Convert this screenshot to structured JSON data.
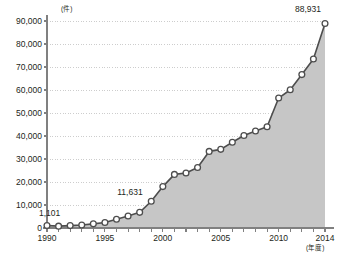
{
  "chart_data": {
    "type": "area",
    "title": "",
    "subtitle": "",
    "xlabel": "(年度)",
    "ylabel": "(件)",
    "x": [
      1990,
      1991,
      1992,
      1993,
      1994,
      1995,
      1996,
      1997,
      1998,
      1999,
      2000,
      2001,
      2002,
      2003,
      2004,
      2005,
      2006,
      2007,
      2008,
      2009,
      2010,
      2011,
      2012,
      2013,
      2014
    ],
    "values": [
      1101,
      800,
      1050,
      1300,
      1800,
      2400,
      3800,
      5200,
      6800,
      11631,
      18000,
      23300,
      23900,
      26300,
      33300,
      34200,
      37300,
      40200,
      42200,
      44000,
      56500,
      60100,
      66700,
      73500,
      88931
    ],
    "series": [
      {
        "name": "件数",
        "values": [
          1101,
          800,
          1050,
          1300,
          1800,
          2400,
          3800,
          5200,
          6800,
          11631,
          18000,
          23300,
          23900,
          26300,
          33300,
          34200,
          37300,
          40200,
          42200,
          44000,
          56500,
          60100,
          66700,
          73500,
          88931
        ]
      }
    ],
    "xlim": [
      1990,
      2014
    ],
    "ylim": [
      0,
      90000
    ],
    "ytick_labels": [
      "0",
      "10,000",
      "20,000",
      "30,000",
      "40,000",
      "50,000",
      "60,000",
      "70,000",
      "80,000",
      "90,000"
    ],
    "ytick_values": [
      0,
      10000,
      20000,
      30000,
      40000,
      50000,
      60000,
      70000,
      80000,
      90000
    ],
    "xtick_labels": [
      "1990",
      "1995",
      "2000",
      "2005",
      "2010",
      "2014"
    ],
    "xtick_values": [
      1990,
      1995,
      2000,
      2005,
      2010,
      2014
    ],
    "grid": true,
    "grid_style": "dotted",
    "legend": false,
    "legend_position": "none",
    "annotations": [
      {
        "label": "1,101",
        "x": 1990,
        "y": 1101
      },
      {
        "label": "11,631",
        "x": 1999,
        "y": 11631
      },
      {
        "label": "88,931",
        "x": 2014,
        "y": 88931
      }
    ],
    "colors": {
      "fill": "#c6c6c6",
      "line": "#4d4d4d",
      "marker_fill": "#ffffff",
      "marker_stroke": "#4d4d4d",
      "axis": "#808080",
      "grid": "#b8b8b8",
      "text": "#231f20",
      "background": "#ffffff"
    }
  }
}
